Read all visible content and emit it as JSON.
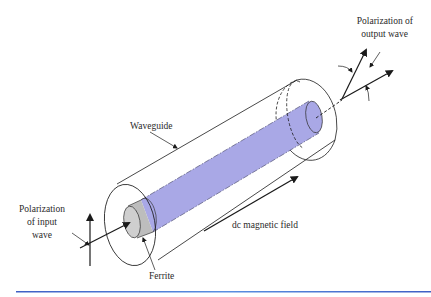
{
  "figure": {
    "type": "ferrite rotator / Faraday rotation diagram",
    "labels": {
      "output_polarization_line1": "Polarization of",
      "output_polarization_line2": "output wave",
      "waveguide": "Waveguide",
      "input_polarization_line1": "Polarization",
      "input_polarization_line2": "of input",
      "input_polarization_line3": "wave",
      "dc_field": "dc magnetic field",
      "ferrite": "Ferrite"
    },
    "colors": {
      "ferrite_rod": "#a9a8e6",
      "ferrite_end": "#bdbdbd",
      "line": "#1a1a1a",
      "rule": "#4a6fd0"
    }
  }
}
